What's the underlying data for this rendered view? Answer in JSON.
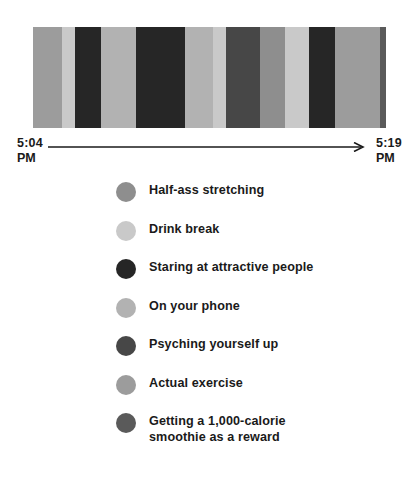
{
  "chart_data": {
    "type": "bar",
    "orientation": "horizontal-stacked-timeline",
    "title": "",
    "xlabel": "",
    "ylabel": "",
    "axis": {
      "start_time": "5:04",
      "start_meridiem": "PM",
      "end_time": "5:19",
      "end_meridiem": "PM",
      "arrow_icon": "right-arrow-icon"
    },
    "categories": [
      "Half-ass stretching",
      "Drink break",
      "Staring at attractive people",
      "On your phone",
      "Psyching yourself up",
      "Actual exercise",
      "Getting a 1,000-calorie smoothie as a reward"
    ],
    "colors": [
      "#8e8e8e",
      "#c9c9c9",
      "#262626",
      "#b2b2b2",
      "#474747",
      "#9c9c9c",
      "#5a5a5a"
    ],
    "segments": [
      {
        "category": "Actual exercise",
        "color": "#9c9c9c",
        "width_pct": 8.31
      },
      {
        "category": "Drink break",
        "color": "#c9c9c9",
        "width_pct": 3.49
      },
      {
        "category": "Staring at attractive people",
        "color": "#262626",
        "width_pct": 7.37
      },
      {
        "category": "On your phone",
        "color": "#b2b2b2",
        "width_pct": 10.1
      },
      {
        "category": "Staring at attractive people",
        "color": "#262626",
        "width_pct": 13.69
      },
      {
        "category": "On your phone",
        "color": "#b2b2b2",
        "width_pct": 8.03
      },
      {
        "category": "Drink break",
        "color": "#c9c9c9",
        "width_pct": 3.59
      },
      {
        "category": "Psyching yourself up",
        "color": "#474747",
        "width_pct": 9.63
      },
      {
        "category": "Half-ass stretching",
        "color": "#8e8e8e",
        "width_pct": 7.27
      },
      {
        "category": "Drink break",
        "color": "#c9c9c9",
        "width_pct": 6.71
      },
      {
        "category": "Staring at attractive people",
        "color": "#262626",
        "width_pct": 7.27
      },
      {
        "category": "Half-ass stretching",
        "color": "#9c9c9c",
        "width_pct": 12.75
      },
      {
        "category": "Getting a 1,000-calorie smoothie as a reward",
        "color": "#5a5a5a",
        "width_pct": 1.79
      }
    ]
  },
  "legend": {
    "items": [
      {
        "label": "Half-ass stretching",
        "color": "#8e8e8e"
      },
      {
        "label": "Drink break",
        "color": "#c9c9c9"
      },
      {
        "label": "Staring at attractive people",
        "color": "#262626"
      },
      {
        "label": "On your phone",
        "color": "#b2b2b2"
      },
      {
        "label": "Psyching yourself up",
        "color": "#474747"
      },
      {
        "label": "Actual exercise",
        "color": "#9c9c9c"
      },
      {
        "label": "Getting a 1,000-calorie\nsmoothie as a reward",
        "color": "#5a5a5a"
      }
    ]
  }
}
